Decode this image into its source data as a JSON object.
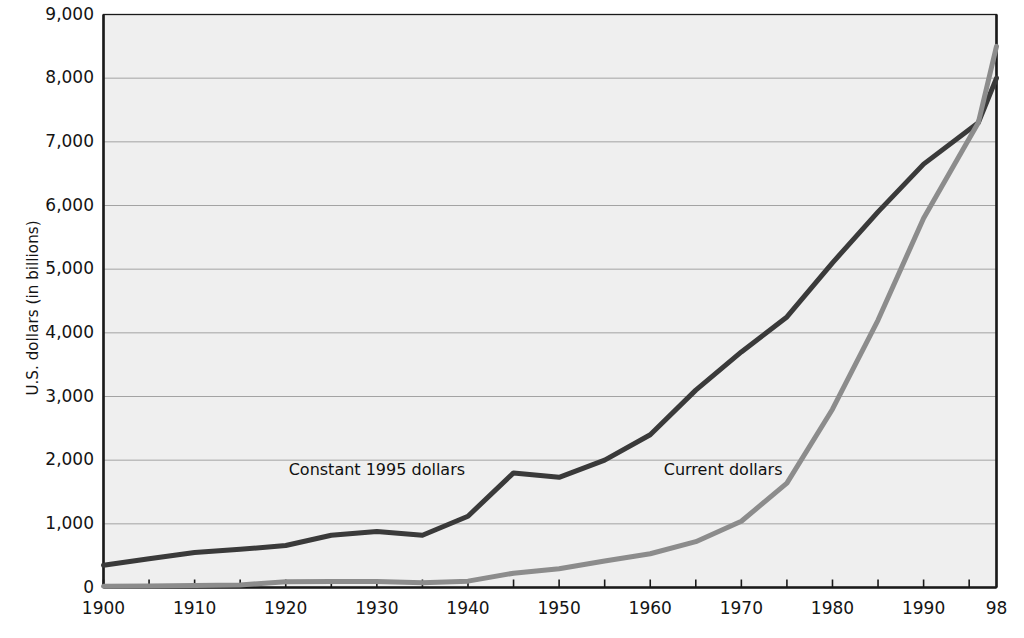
{
  "chart_data": {
    "type": "line",
    "title": "",
    "xlabel": "",
    "ylabel": "U.S. dollars (in billions)",
    "xlim": [
      1900,
      1998
    ],
    "ylim": [
      0,
      9000
    ],
    "grid": true,
    "legend_position": "inline-annotations",
    "y_ticks": [
      9000,
      8000,
      7000,
      6000,
      5000,
      4000,
      3000,
      2000,
      1000,
      0
    ],
    "y_tick_labels": [
      "9,000",
      "8,000",
      "7,000",
      "6,000",
      "5,000",
      "4,000",
      "3,000",
      "2,000",
      "1,000",
      "0"
    ],
    "x_ticks": [
      1900,
      1910,
      1920,
      1930,
      1940,
      1950,
      1960,
      1970,
      1980,
      1990,
      1998
    ],
    "x_tick_labels": [
      "1900",
      "1910",
      "1920",
      "1930",
      "1940",
      "1950",
      "1960",
      "1970",
      "1980",
      "1990",
      "98"
    ],
    "x_minor_tick_interval": 5,
    "x": [
      1900,
      1905,
      1910,
      1915,
      1920,
      1925,
      1930,
      1935,
      1940,
      1945,
      1950,
      1955,
      1960,
      1965,
      1970,
      1975,
      1980,
      1985,
      1990,
      1996,
      1998
    ],
    "series": [
      {
        "name": "Constant 1995 dollars",
        "color": "#3a3a3a",
        "label_x": 1930,
        "label_y": 1850,
        "values": [
          350,
          450,
          550,
          600,
          660,
          820,
          880,
          820,
          1120,
          1800,
          1730,
          2000,
          2400,
          3100,
          3700,
          4250,
          5100,
          5900,
          6650,
          7300,
          8000
        ]
      },
      {
        "name": "Current dollars",
        "color": "#8c8c8c",
        "label_x": 1968,
        "label_y": 1850,
        "values": [
          18,
          25,
          33,
          40,
          90,
          95,
          95,
          75,
          100,
          225,
          295,
          415,
          530,
          720,
          1040,
          1640,
          2800,
          4200,
          5800,
          7300,
          8500
        ]
      }
    ],
    "annotations": [
      {
        "text": "Constant 1995 dollars",
        "series": "Constant 1995 dollars"
      },
      {
        "text": "Current dollars",
        "series": "Current dollars"
      }
    ]
  },
  "style": {
    "plot_background": "#efefef",
    "gridline_color": "#9a9a9a",
    "axis_color": "#1a1a1a",
    "page_background": "#ffffff"
  }
}
